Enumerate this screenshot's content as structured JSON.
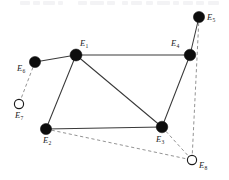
{
  "figure": {
    "width": 229,
    "height": 180,
    "background_color": "#ffffff"
  },
  "style": {
    "solid_edge_color": "#3a3a3a",
    "dashed_edge_color": "#8d8d8d",
    "filled_node_color": "#0d0d0d",
    "hollow_node_fill": "#ffffff",
    "hollow_node_stroke": "#1a1a1a",
    "label_color": "#1b1b1b"
  },
  "nodes": [
    {
      "id": "E5",
      "base": "E",
      "sub": "5",
      "x": 199,
      "y": 17,
      "r": 5.6,
      "fill": "filled",
      "label_dx": 8,
      "label_dy": -4
    },
    {
      "id": "E1",
      "base": "E",
      "sub": "1",
      "x": 76,
      "y": 55,
      "r": 6.0,
      "fill": "filled",
      "label_dx": 4,
      "label_dy": -16
    },
    {
      "id": "E4",
      "base": "E",
      "sub": "4",
      "x": 190,
      "y": 55,
      "r": 5.8,
      "fill": "filled",
      "label_dx": -19,
      "label_dy": -16
    },
    {
      "id": "E6",
      "base": "E",
      "sub": "6",
      "x": 35,
      "y": 62,
      "r": 5.6,
      "fill": "filled",
      "label_dx": -18,
      "label_dy": 2
    },
    {
      "id": "E7",
      "base": "E",
      "sub": "7",
      "x": 19,
      "y": 104,
      "r": 4.6,
      "fill": "hollow",
      "label_dx": -4,
      "label_dy": 7
    },
    {
      "id": "E2",
      "base": "E",
      "sub": "2",
      "x": 46,
      "y": 129,
      "r": 5.6,
      "fill": "filled",
      "label_dx": -3,
      "label_dy": 7
    },
    {
      "id": "E3",
      "base": "E",
      "sub": "3",
      "x": 162,
      "y": 127,
      "r": 5.8,
      "fill": "filled",
      "label_dx": -6,
      "label_dy": 8
    },
    {
      "id": "E8",
      "base": "E",
      "sub": "8",
      "x": 192,
      "y": 160,
      "r": 4.6,
      "fill": "hollow",
      "label_dx": 7,
      "label_dy": 1
    }
  ],
  "edges": [
    {
      "from": "E6",
      "to": "E1",
      "style": "solid"
    },
    {
      "from": "E1",
      "to": "E4",
      "style": "solid"
    },
    {
      "from": "E1",
      "to": "E2",
      "style": "solid"
    },
    {
      "from": "E1",
      "to": "E3",
      "style": "solid"
    },
    {
      "from": "E2",
      "to": "E3",
      "style": "solid"
    },
    {
      "from": "E3",
      "to": "E4",
      "style": "solid"
    },
    {
      "from": "E4",
      "to": "E5",
      "style": "solid"
    },
    {
      "from": "E6",
      "to": "E7",
      "style": "dashed"
    },
    {
      "from": "E2",
      "to": "E8",
      "style": "dashed"
    },
    {
      "from": "E3",
      "to": "E8",
      "style": "dashed"
    },
    {
      "from": "E5",
      "to": "E8",
      "style": "dashed"
    }
  ],
  "top_artifact": {
    "description": "faint clipped text row at very top edge of the scan",
    "color": "#efeff1",
    "segments": [
      {
        "x": 20,
        "w": 10
      },
      {
        "x": 33,
        "w": 7
      },
      {
        "x": 43,
        "w": 12
      },
      {
        "x": 58,
        "w": 5
      },
      {
        "x": 78,
        "w": 9
      },
      {
        "x": 90,
        "w": 14
      },
      {
        "x": 107,
        "w": 8
      },
      {
        "x": 122,
        "w": 6
      },
      {
        "x": 131,
        "w": 11
      },
      {
        "x": 146,
        "w": 7
      },
      {
        "x": 157,
        "w": 13
      },
      {
        "x": 173,
        "w": 6
      },
      {
        "x": 183,
        "w": 10
      },
      {
        "x": 196,
        "w": 8
      },
      {
        "x": 208,
        "w": 11
      }
    ]
  }
}
